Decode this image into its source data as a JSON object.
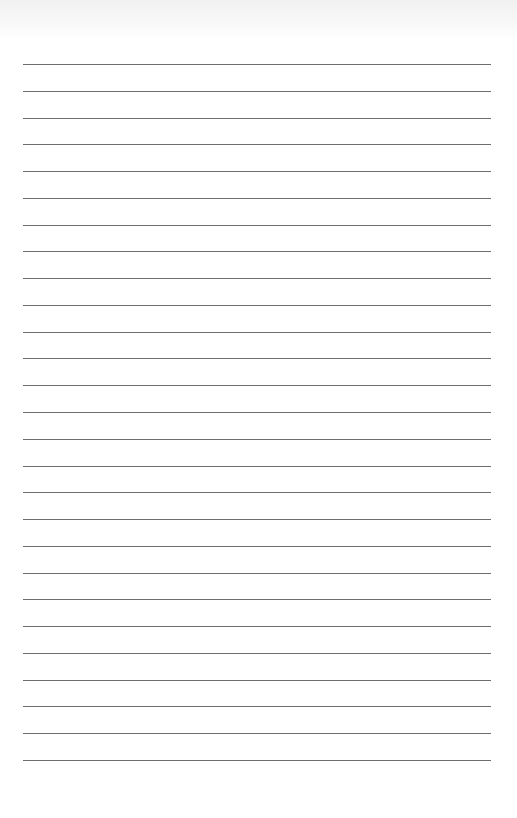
{
  "page": {
    "type": "lined-paper",
    "line_count": 27,
    "first_line_y": 64,
    "line_spacing": 26.77,
    "line_left": 23,
    "line_width": 468,
    "line_color": "#6e6e6e",
    "background_color": "#ffffff"
  }
}
